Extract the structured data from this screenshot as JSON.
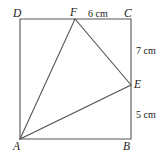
{
  "figure": {
    "type": "geometry-diagram",
    "stroke_color": "#555555",
    "label_color": "#1a1a1a",
    "background": "#ffffff",
    "vertices": {
      "D": {
        "label": "D",
        "x": 20,
        "y": 19
      },
      "C": {
        "label": "C",
        "x": 131,
        "y": 19
      },
      "B": {
        "label": "B",
        "x": 131,
        "y": 139
      },
      "A": {
        "label": "A",
        "x": 20,
        "y": 139
      },
      "F": {
        "label": "F",
        "x": 75,
        "y": 19
      },
      "E": {
        "label": "E",
        "x": 131,
        "y": 85
      }
    },
    "dimensions": {
      "FC": "6 cm",
      "CE": "7 cm",
      "EB": "5 cm"
    },
    "square_path": "M 20 19 L 131 19 L 131 139 L 20 139 Z",
    "triangle_path": "M 20 139 L 75 19 L 131 85 Z"
  }
}
